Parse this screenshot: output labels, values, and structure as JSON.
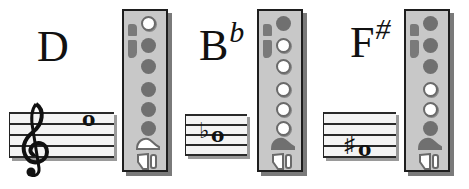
{
  "diagram": {
    "title": "",
    "fingerings": [
      {
        "note": "D",
        "accidental": "",
        "staff": {
          "clef": "treble",
          "accidental_symbol": "",
          "note_symbol": "o"
        },
        "holes": [
          "open",
          "closed",
          "closed",
          "closed",
          "closed",
          "closed"
        ],
        "bottom_key": "open"
      },
      {
        "note": "B",
        "accidental": "b",
        "staff": {
          "clef": "",
          "accidental_symbol": "♭",
          "note_symbol": "o"
        },
        "holes": [
          "closed",
          "open",
          "open",
          "open",
          "open",
          "open"
        ],
        "bottom_key": "closed"
      },
      {
        "note": "F",
        "accidental": "#",
        "staff": {
          "clef": "",
          "accidental_symbol": "♯",
          "note_symbol": "o"
        },
        "holes": [
          "closed",
          "closed",
          "closed",
          "open",
          "open",
          "closed"
        ],
        "bottom_key": "closed"
      }
    ]
  },
  "colors": {
    "chart_bg": "#c8c8c8",
    "hole_closed": "#707070",
    "hole_open": "#ffffff",
    "border": "#1e1e1e"
  }
}
